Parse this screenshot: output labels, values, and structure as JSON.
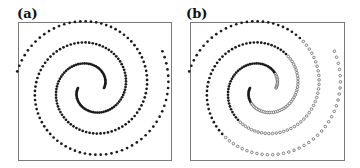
{
  "panels": [
    {
      "label": "(a)",
      "label_x": 17,
      "label_y": 7,
      "box": [
        18,
        22,
        171,
        160
      ],
      "center": [
        91,
        88
      ],
      "mode": "all_filled"
    },
    {
      "label": "(b)",
      "label_x": 186,
      "label_y": 7,
      "box": [
        190,
        22,
        344,
        160
      ],
      "center": [
        263,
        88
      ],
      "mode": "split"
    }
  ],
  "colors": {
    "dot": "#1a1a1a",
    "hollow_stroke": "#555555",
    "box": "#7a7a7a"
  },
  "chart_data": {
    "type": "scatter",
    "subplots": [
      {
        "label": "(a)",
        "description": "Two interleaved Archimedean spirals, all points drawn as filled dots (unlabeled data)",
        "series": [
          {
            "name": "spiral 1",
            "marker": "filled",
            "r0": 13,
            "k": 6.8,
            "theta_start": 0,
            "theta_span": 9.6,
            "points": 122
          },
          {
            "name": "spiral 2",
            "marker": "filled",
            "r0": 13,
            "k": 6.8,
            "theta_start": 3.1416,
            "theta_span": 9.9,
            "points": 126
          }
        ],
        "axes": "none",
        "grid": false
      },
      {
        "label": "(b)",
        "description": "Same spirals, classified by a linear boundary through the center: upper-left filled, lower-right hollow",
        "series": [
          {
            "name": "class filled",
            "marker": "filled"
          },
          {
            "name": "class hollow",
            "marker": "hollow"
          }
        ],
        "boundary_normal": [
          0.79,
          0.62
        ],
        "axes": "none",
        "grid": false
      }
    ]
  }
}
